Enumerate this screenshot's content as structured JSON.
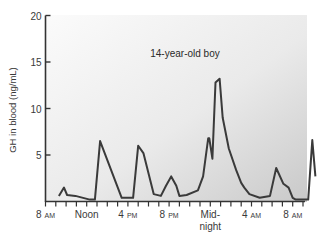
{
  "chart_data": {
    "type": "line",
    "title": "",
    "annotation": "14-year-old boy",
    "xlabel": "",
    "ylabel": "GH in blood (ng/mL)",
    "ylim": [
      0,
      20
    ],
    "yticks": [
      5,
      10,
      15,
      20
    ],
    "y_tick_labels": [
      "5",
      "10",
      "15",
      "20"
    ],
    "x_unit": "hours after 8 AM",
    "xlim": [
      0,
      25
    ],
    "x_tick_positions_hours": [
      0,
      1,
      2,
      3,
      4,
      5,
      6,
      7,
      8,
      9,
      10,
      11,
      12,
      13,
      14,
      15,
      16,
      17,
      18,
      19,
      20,
      21,
      22,
      23,
      24,
      25
    ],
    "x_labels": [
      {
        "hour": 0,
        "main": "8",
        "suffix": "AM"
      },
      {
        "hour": 4,
        "main": "Noon",
        "suffix": ""
      },
      {
        "hour": 8,
        "main": "4",
        "suffix": "PM"
      },
      {
        "hour": 12,
        "main": "8",
        "suffix": "PM"
      },
      {
        "hour": 16,
        "main": "Mid-",
        "suffix": "",
        "line2": "night"
      },
      {
        "hour": 20,
        "main": "4",
        "suffix": "AM"
      },
      {
        "hour": 24,
        "main": "8",
        "suffix": "AM"
      }
    ],
    "grid": false,
    "legend": null,
    "series": [
      {
        "name": "GH concentration",
        "color": "#3a3a3a",
        "x": [
          1.3,
          1.8,
          2.1,
          2.9,
          4.3,
          4.8,
          5.3,
          7.4,
          8.5,
          9.0,
          9.5,
          10.5,
          11.2,
          11.7,
          12.2,
          12.7,
          13.0,
          13.7,
          14.8,
          15.3,
          15.8,
          15.9,
          16.2,
          16.5,
          16.9,
          17.2,
          17.8,
          18.5,
          19.0,
          19.3,
          19.8,
          20.8,
          21.8,
          22.4,
          23.1,
          23.6,
          24.0,
          24.3,
          25.5,
          25.9,
          26.2
        ],
        "values": [
          0.6,
          1.5,
          0.7,
          0.6,
          0.2,
          0.2,
          6.5,
          0.4,
          0.4,
          6.0,
          5.2,
          0.8,
          0.6,
          1.7,
          2.7,
          1.7,
          0.6,
          0.7,
          1.2,
          2.7,
          6.8,
          6.8,
          4.6,
          12.8,
          13.2,
          9.0,
          5.7,
          3.4,
          2.0,
          1.5,
          0.8,
          0.4,
          0.6,
          3.6,
          1.9,
          1.5,
          0.4,
          0.2,
          0.2,
          6.6,
          2.7
        ]
      }
    ]
  }
}
